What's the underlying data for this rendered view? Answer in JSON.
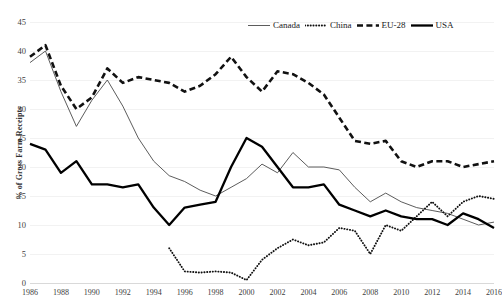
{
  "chart_data": {
    "type": "line",
    "title": "",
    "xlabel": "",
    "ylabel": "% of Gross Farm Receipts",
    "xlim": [
      1986,
      2016
    ],
    "ylim": [
      0,
      45
    ],
    "y_ticks": [
      0,
      5,
      10,
      15,
      20,
      25,
      30,
      35,
      40,
      45
    ],
    "x_ticks": [
      1986,
      1988,
      1990,
      1992,
      1994,
      1996,
      1998,
      2000,
      2002,
      2004,
      2006,
      2008,
      2010,
      2012,
      2014,
      2016
    ],
    "grid": "horizontal",
    "legend_position": "top-right",
    "x": [
      1986,
      1987,
      1988,
      1989,
      1990,
      1991,
      1992,
      1993,
      1994,
      1995,
      1996,
      1997,
      1998,
      1999,
      2000,
      2001,
      2002,
      2003,
      2004,
      2005,
      2006,
      2007,
      2008,
      2009,
      2010,
      2011,
      2012,
      2013,
      2014,
      2015,
      2016
    ],
    "series": [
      {
        "name": "Canada",
        "style": "thin-solid",
        "color": "#4a4a4a",
        "values": [
          38.0,
          40.0,
          33.0,
          27.0,
          31.5,
          35.0,
          30.5,
          25.0,
          21.0,
          18.5,
          17.5,
          16.0,
          15.0,
          16.5,
          18.0,
          20.5,
          19.0,
          22.5,
          20.0,
          20.0,
          19.5,
          16.5,
          14.0,
          15.5,
          14.0,
          13.0,
          12.5,
          12.0,
          11.0,
          10.0,
          10.5
        ]
      },
      {
        "name": "China",
        "style": "dotted",
        "color": "#111111",
        "values": [
          null,
          null,
          null,
          null,
          null,
          null,
          null,
          null,
          null,
          6.0,
          2.0,
          1.8,
          2.0,
          1.8,
          0.5,
          4.0,
          6.0,
          7.5,
          6.5,
          7.0,
          9.5,
          9.0,
          5.0,
          10.0,
          9.0,
          11.5,
          14.0,
          11.5,
          14.0,
          15.0,
          14.5
        ]
      },
      {
        "name": "EU-28",
        "style": "dashed",
        "color": "#111111",
        "values": [
          39.0,
          41.0,
          34.0,
          30.0,
          32.0,
          37.0,
          34.5,
          35.5,
          35.0,
          34.5,
          33.0,
          34.0,
          36.0,
          39.0,
          35.5,
          33.0,
          36.5,
          36.0,
          34.5,
          32.5,
          28.5,
          24.5,
          24.0,
          24.5,
          21.0,
          20.0,
          21.0,
          21.0,
          20.0,
          20.5,
          21.0
        ]
      },
      {
        "name": "USA",
        "style": "thick-solid",
        "color": "#000000",
        "values": [
          24.0,
          23.0,
          19.0,
          21.0,
          17.0,
          17.0,
          16.5,
          17.0,
          13.0,
          10.0,
          13.0,
          13.5,
          14.0,
          20.0,
          25.0,
          23.5,
          20.0,
          16.5,
          16.5,
          17.0,
          13.5,
          12.5,
          11.5,
          12.5,
          11.5,
          11.0,
          11.0,
          10.0,
          12.0,
          11.0,
          9.5
        ]
      }
    ]
  },
  "legend": {
    "items": [
      {
        "label": "Canada",
        "icon": "thin-solid-line-icon"
      },
      {
        "label": "China",
        "icon": "dotted-line-icon"
      },
      {
        "label": "EU-28",
        "icon": "dashed-line-icon"
      },
      {
        "label": "USA",
        "icon": "thick-solid-line-icon"
      }
    ]
  },
  "axes": {
    "y_title": "% of Gross Farm Receipts",
    "y_tick_labels": [
      "45",
      "40",
      "35",
      "30",
      "25",
      "20",
      "15",
      "10",
      "5",
      "0"
    ],
    "x_tick_labels": [
      "1986",
      "1988",
      "1990",
      "1992",
      "1994",
      "1996",
      "1998",
      "2000",
      "2002",
      "2004",
      "2006",
      "2008",
      "2010",
      "2012",
      "2014",
      "2016"
    ]
  }
}
